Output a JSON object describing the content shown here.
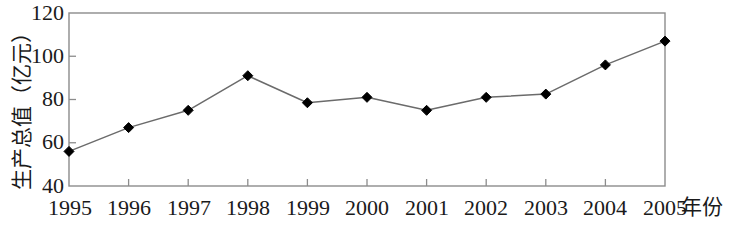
{
  "chart_data": {
    "type": "line",
    "title": "",
    "subtitle": "",
    "xlabel": "年份",
    "ylabel": "生产总值（亿元）",
    "categories": [
      "1995",
      "1996",
      "1997",
      "1998",
      "1999",
      "2000",
      "2001",
      "2002",
      "2003",
      "2004",
      "2005"
    ],
    "values": [
      56,
      67,
      75,
      91,
      78.5,
      81,
      75,
      81,
      82.5,
      96,
      107
    ],
    "series": [
      {
        "name": "生产总值",
        "values": [
          56,
          67,
          75,
          91,
          78.5,
          81,
          75,
          81,
          82.5,
          96,
          107
        ]
      }
    ],
    "ylim": [
      40,
      120
    ],
    "xlim": [
      "1995",
      "2005"
    ],
    "ytick_labels": [
      "40",
      "60",
      "80",
      "100",
      "120"
    ],
    "ytick_values": [
      40,
      60,
      80,
      100,
      120
    ],
    "grid": false,
    "legend": false,
    "legend_position": "none",
    "marker": "diamond",
    "marker_color": "#000000",
    "line_color": "#6b6b6b",
    "frame_color": "#8c8c8c",
    "background": "#ffffff",
    "annotations": []
  }
}
